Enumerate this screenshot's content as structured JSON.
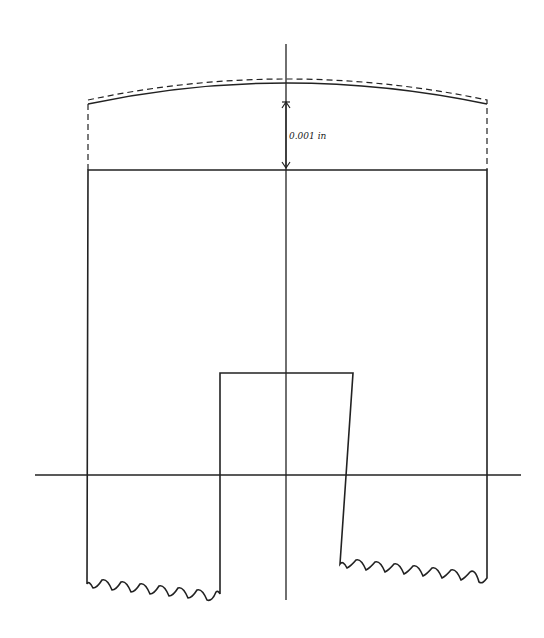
{
  "diagram": {
    "dimension_label": "0.001 in",
    "stroke_color": "#222222",
    "background": "#ffffff"
  }
}
